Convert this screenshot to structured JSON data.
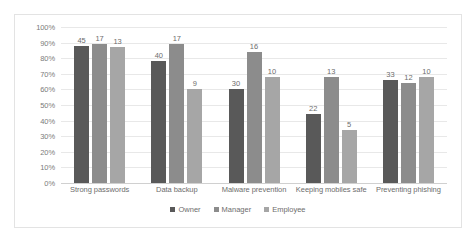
{
  "chart_data": {
    "type": "bar",
    "title": "",
    "subtitle": "",
    "xlabel": "",
    "ylabel": "",
    "ylim": [
      0,
      100
    ],
    "grid": true,
    "legend_position": "bottom",
    "categories": [
      "Strong passwords",
      "Data backup",
      "Malware prevention",
      "Keeping mobiles safe",
      "Preventing phishing"
    ],
    "ytick_labels": [
      "100%",
      "90%",
      "80%",
      "70%",
      "60%",
      "50%",
      "40%",
      "30%",
      "20%",
      "10%",
      "0%"
    ],
    "ytick_values": [
      100,
      90,
      80,
      70,
      60,
      50,
      40,
      30,
      20,
      10,
      0
    ],
    "series": [
      {
        "name": "Owner",
        "color": "#595959",
        "values": [
          88,
          78,
          60,
          44,
          66
        ],
        "data_labels": [
          "45",
          "40",
          "30",
          "22",
          "33"
        ]
      },
      {
        "name": "Manager",
        "color": "#8c8c8c",
        "values": [
          89,
          89,
          84,
          68,
          64
        ],
        "data_labels": [
          "17",
          "17",
          "16",
          "13",
          "12"
        ]
      },
      {
        "name": "Employee",
        "color": "#a6a6a6",
        "values": [
          87,
          60,
          68,
          34,
          68
        ],
        "data_labels": [
          "13",
          "9",
          "10",
          "5",
          "10"
        ]
      }
    ]
  },
  "legend": {
    "items": [
      {
        "label": "Owner",
        "color": "#595959"
      },
      {
        "label": "Manager",
        "color": "#8c8c8c"
      },
      {
        "label": "Employee",
        "color": "#a6a6a6"
      }
    ]
  },
  "colors": {
    "owner": "#595959",
    "manager": "#8c8c8c",
    "employee": "#a6a6a6",
    "gridline": "#e8e8e8",
    "axis_text": "#7b7b7b",
    "border": "#e3e3e3",
    "background": "#ffffff"
  }
}
